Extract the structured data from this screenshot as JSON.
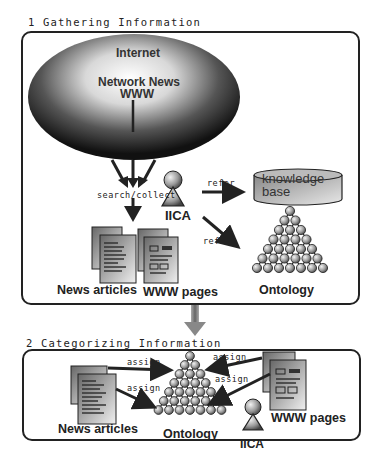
{
  "section1": {
    "title": "1 Gathering Information",
    "internet": {
      "title": "Internet",
      "line1": "Network News",
      "line2": "WWW"
    },
    "search_collect": "search/collect",
    "agent": "IICA",
    "refer_kb": "refer",
    "refer_ontology": "refer",
    "knowledge_base": {
      "line1": "knowledge",
      "line2": "base"
    },
    "news_articles": "News articles",
    "www_pages": "WWW pages",
    "ontology": "Ontology"
  },
  "section2": {
    "title": "2 Categorizing Information",
    "assign_labels": [
      "assign",
      "assign",
      "assign",
      "assign"
    ],
    "news_articles": "News articles",
    "ontology": "Ontology",
    "www_pages": "WWW pages",
    "agent": "IICA"
  }
}
